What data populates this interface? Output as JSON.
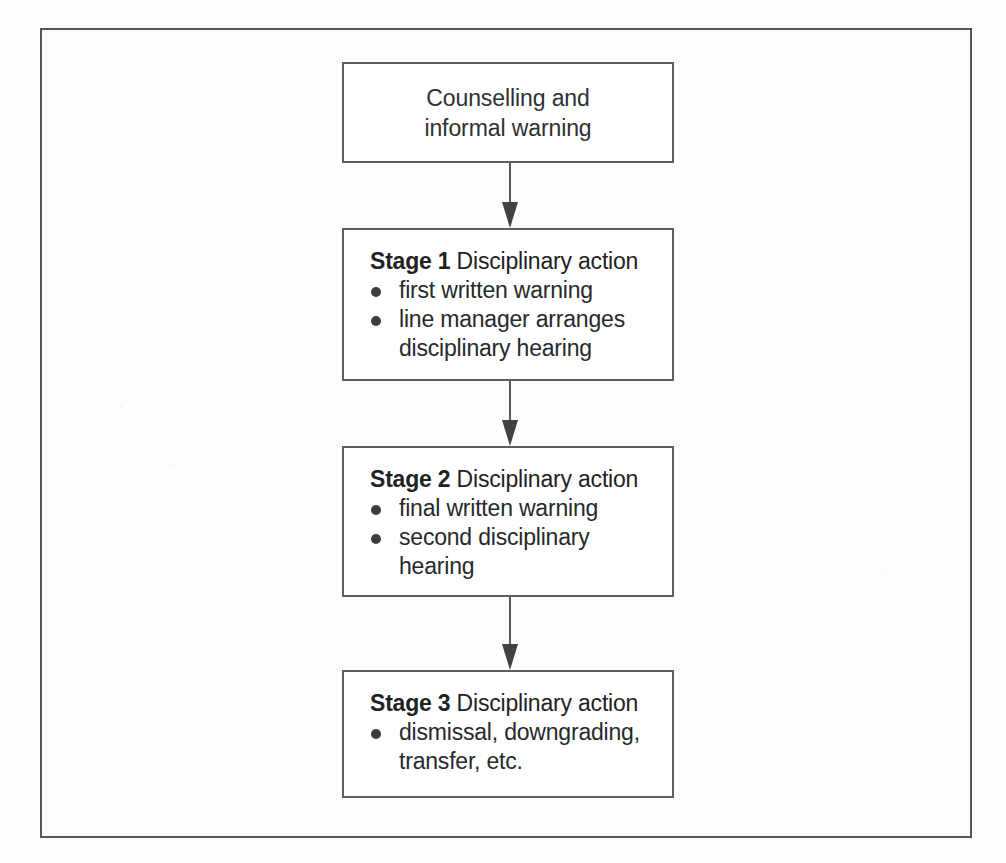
{
  "diagram": {
    "frame": {
      "label": "outer-border"
    },
    "colors": {
      "border": "#5a5f63",
      "outer_border": "#53585c",
      "text": "#26292b",
      "bullet": "#3a3d40",
      "arrow": "#3f4245",
      "background": "#fdfdfd",
      "box_fill": "#ffffff"
    },
    "nodes": [
      {
        "id": "counselling",
        "kind": "centered-text",
        "lines": [
          "Counselling and",
          "informal warning"
        ]
      },
      {
        "id": "stage-1",
        "kind": "stage",
        "stage_label": "Stage 1",
        "heading_rest": " Disciplinary action",
        "bullets": [
          "first written warning",
          "line manager arranges disciplinary hearing"
        ]
      },
      {
        "id": "stage-2",
        "kind": "stage",
        "stage_label": "Stage 2",
        "heading_rest": " Disciplinary action",
        "bullets": [
          "final written warning",
          "second disciplinary hearing"
        ]
      },
      {
        "id": "stage-3",
        "kind": "stage",
        "stage_label": "Stage 3",
        "heading_rest": " Disciplinary action",
        "bullets": [
          "dismissal, downgrading, transfer, etc."
        ]
      }
    ],
    "connectors": [
      {
        "id": "arrow-1",
        "from": "counselling",
        "to": "stage-1",
        "icon": "down-arrow-icon"
      },
      {
        "id": "arrow-2",
        "from": "stage-1",
        "to": "stage-2",
        "icon": "down-arrow-icon"
      },
      {
        "id": "arrow-3",
        "from": "stage-2",
        "to": "stage-3",
        "icon": "down-arrow-icon"
      }
    ]
  }
}
